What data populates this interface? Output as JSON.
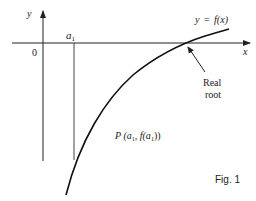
{
  "figure": {
    "caption": "Fig. 1",
    "axes": {
      "x_label": "x",
      "y_label": "y",
      "origin_label": "0"
    },
    "curve": {
      "label_lhs": "y",
      "label_eq": "=",
      "label_rhs": "f(x)"
    },
    "marker": {
      "label": "a",
      "subscript": "1"
    },
    "root": {
      "label_line1": "Real",
      "label_line2": "root"
    },
    "point": {
      "label_prefix": "P (",
      "a_label": "a",
      "a_sub": "1",
      "mid": ", f(a",
      "f_sub": "1",
      "suffix": "))"
    },
    "colors": {
      "line": "#222222",
      "background": "#ffffff"
    }
  }
}
